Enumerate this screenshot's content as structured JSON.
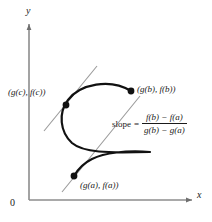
{
  "figure": {
    "axes": {
      "x_label": "x",
      "y_label": "y",
      "origin_label": "0",
      "axis_color": "#8c8c8c"
    },
    "curve": {
      "name": "parametric-curve",
      "color": "#111111"
    },
    "lines": {
      "tangent_line": "tangent-at-c",
      "secant_line": "secant-a-b",
      "color": "#9a9a9a"
    },
    "points": [
      {
        "id": "point-c",
        "label": "(g(c), f(c))",
        "x": 66,
        "y": 105
      },
      {
        "id": "point-b",
        "label": "(g(b), f(b))",
        "x": 131,
        "y": 91
      },
      {
        "id": "point-a",
        "label": "(g(a), f(a))",
        "x": 74,
        "y": 176
      }
    ],
    "slope": {
      "word": "slope",
      "equals": "=",
      "numerator": "f(b) − f(a)",
      "denominator": "g(b) − g(a)"
    }
  }
}
